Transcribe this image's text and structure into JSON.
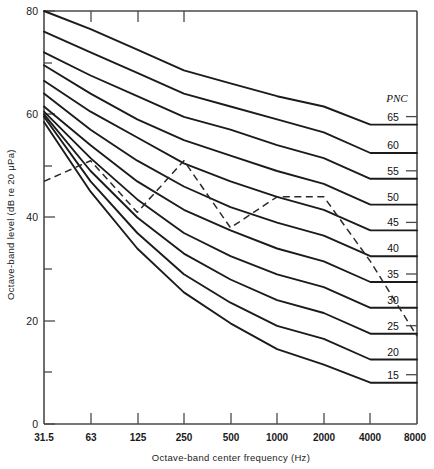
{
  "chart_data": {
    "type": "line",
    "title": "",
    "xlabel": "Octave-band center frequency (Hz)",
    "ylabel": "Octave-band level (dB re 20 μPa)",
    "x_tick_labels": [
      "31.5",
      "63",
      "125",
      "250",
      "500",
      "1000",
      "2000",
      "4000",
      "8000"
    ],
    "x_values": [
      31.5,
      63,
      125,
      250,
      500,
      1000,
      2000,
      4000,
      8000
    ],
    "y_tick_labels": [
      "0",
      "20",
      "40",
      "60",
      "80"
    ],
    "y_major_ticks": [
      0,
      20,
      40,
      60,
      80
    ],
    "y_minor_ticks": [
      10,
      30,
      50,
      70
    ],
    "ylim": [
      0,
      80
    ],
    "grid": false,
    "legend_position": "right-edge-inline",
    "legend_header": "PNC",
    "series": [
      {
        "name": "PNC 65",
        "label": "65",
        "style": "solid",
        "values": [
          80.0,
          76.5,
          72.5,
          68.5,
          66.0,
          63.5,
          61.5,
          58.0,
          58.0
        ]
      },
      {
        "name": "PNC 60",
        "label": "60",
        "style": "solid",
        "values": [
          76.0,
          72.0,
          68.0,
          64.0,
          61.5,
          59.0,
          56.5,
          52.5,
          52.5
        ]
      },
      {
        "name": "PNC 55",
        "label": "55",
        "style": "solid",
        "values": [
          72.0,
          67.5,
          63.5,
          59.5,
          57.0,
          54.0,
          51.5,
          47.5,
          47.5
        ]
      },
      {
        "name": "PNC 50",
        "label": "50",
        "style": "solid",
        "values": [
          69.5,
          64.0,
          59.0,
          55.0,
          52.0,
          49.0,
          46.5,
          42.5,
          42.5
        ]
      },
      {
        "name": "PNC 45",
        "label": "45",
        "style": "solid",
        "values": [
          66.5,
          60.5,
          55.5,
          50.5,
          47.0,
          44.0,
          41.5,
          37.5,
          37.5
        ]
      },
      {
        "name": "PNC 40",
        "label": "40",
        "style": "solid",
        "values": [
          64.0,
          57.0,
          51.0,
          46.0,
          42.0,
          39.0,
          36.5,
          32.5,
          32.5
        ]
      },
      {
        "name": "PNC 35",
        "label": "35",
        "style": "solid",
        "values": [
          61.5,
          54.0,
          47.0,
          41.5,
          37.5,
          34.0,
          31.5,
          27.5,
          27.5
        ]
      },
      {
        "name": "PNC 30",
        "label": "30",
        "style": "solid",
        "values": [
          60.5,
          51.5,
          43.5,
          37.0,
          32.5,
          29.0,
          26.5,
          22.5,
          22.5
        ]
      },
      {
        "name": "PNC 25",
        "label": "25",
        "style": "solid",
        "values": [
          60.0,
          49.0,
          40.0,
          33.0,
          28.0,
          24.0,
          21.5,
          17.5,
          17.5
        ]
      },
      {
        "name": "PNC 20",
        "label": "20",
        "style": "solid",
        "values": [
          59.5,
          47.0,
          37.0,
          29.0,
          23.5,
          19.0,
          16.5,
          12.5,
          12.5
        ]
      },
      {
        "name": "PNC 15",
        "label": "15",
        "style": "solid",
        "values": [
          58.5,
          45.0,
          34.0,
          25.5,
          19.5,
          14.5,
          11.5,
          8.0,
          8.0
        ]
      },
      {
        "name": "Measured spectrum",
        "label": "",
        "style": "dashed",
        "values": [
          47.0,
          51.0,
          41.0,
          51.0,
          38.0,
          44.0,
          44.0,
          31.5,
          17.0
        ]
      }
    ],
    "annotations": [
      {
        "text": "PNC",
        "role": "legend-column-header"
      }
    ]
  }
}
